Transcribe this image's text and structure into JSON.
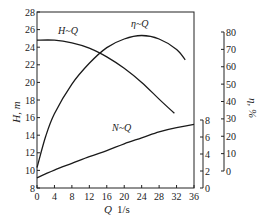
{
  "chart_data": {
    "type": "line",
    "title": "",
    "xlabel": "Q  1/s",
    "x_axis": {
      "label_symbol": "Q",
      "label_unit": "1/s",
      "range": [
        0,
        36
      ],
      "ticks": [
        0,
        4,
        8,
        12,
        16,
        20,
        24,
        28,
        32,
        36
      ]
    },
    "y_axes": [
      {
        "id": "H",
        "label": "H, m",
        "position": "left",
        "range": [
          8,
          28
        ],
        "ticks": [
          8,
          10,
          12,
          14,
          16,
          18,
          20,
          22,
          24,
          26,
          28
        ]
      },
      {
        "id": "N",
        "label": "",
        "position": "right-inner",
        "range": [
          0,
          8
        ],
        "ticks": [
          0,
          2,
          4,
          6,
          8
        ]
      },
      {
        "id": "eta",
        "label": "η, %",
        "position": "right-outer",
        "range": [
          0,
          80
        ],
        "ticks": [
          0,
          10,
          20,
          30,
          40,
          50,
          60,
          70,
          80
        ]
      }
    ],
    "grid": false,
    "legend": "none (inline curve labels)",
    "series": [
      {
        "name": "H~Q",
        "axis": "H",
        "x": [
          0,
          4,
          8,
          12,
          16,
          20,
          24,
          28,
          31.5
        ],
        "values": [
          24.8,
          24.8,
          24.5,
          23.9,
          22.9,
          21.6,
          20.0,
          18.1,
          16.5
        ]
      },
      {
        "name": "η~Q",
        "axis": "eta",
        "x": [
          0,
          2,
          4,
          8,
          12,
          16,
          20,
          24,
          28,
          32,
          34
        ],
        "values": [
          2,
          20,
          33,
          50,
          62,
          71,
          76,
          78,
          76,
          70,
          64
        ]
      },
      {
        "name": "N~Q",
        "axis": "N",
        "x": [
          0,
          4,
          8,
          12,
          16,
          20,
          24,
          28,
          32,
          36
        ],
        "values": [
          1.2,
          2.1,
          2.9,
          3.7,
          4.4,
          5.2,
          5.9,
          6.6,
          7.1,
          7.5
        ]
      }
    ]
  },
  "labels": {
    "h_axis": "H, m",
    "eta_axis": "η, %",
    "x_symbol": "Q",
    "x_unit": "1/s",
    "curve_h": "H~Q",
    "curve_eta": "η~Q",
    "curve_n": "N~Q"
  }
}
